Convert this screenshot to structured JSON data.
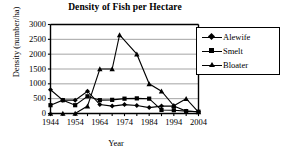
{
  "chart_data": {
    "type": "line",
    "title": "Density of Fish per Hectare",
    "xlabel": "Year",
    "ylabel": "Density (number/ha)",
    "xlim": [
      1944,
      2004
    ],
    "ylim": [
      0,
      3000
    ],
    "yticks": [
      0,
      500,
      1000,
      1500,
      2000,
      2500,
      3000
    ],
    "xticks": [
      1944,
      1954,
      1964,
      1974,
      1984,
      1994,
      2004
    ],
    "xminor_step": 5,
    "grid": "horizontal",
    "legend_position": "top-right",
    "series": [
      {
        "name": "Alewife",
        "marker": "diamond",
        "color": "#000000",
        "x": [
          1944,
          1949,
          1954,
          1959,
          1964,
          1969,
          1974,
          1979,
          1984,
          1989,
          1994,
          1999,
          2004
        ],
        "y": [
          800,
          450,
          450,
          750,
          300,
          250,
          300,
          270,
          200,
          250,
          250,
          80,
          60
        ]
      },
      {
        "name": "Smelt",
        "marker": "square",
        "color": "#000000",
        "x": [
          1944,
          1949,
          1954,
          1959,
          1964,
          1969,
          1974,
          1979,
          1984,
          1989,
          1994,
          1999,
          2004
        ],
        "y": [
          280,
          450,
          280,
          580,
          450,
          460,
          500,
          510,
          500,
          120,
          110,
          80,
          60
        ]
      },
      {
        "name": "Bloater",
        "marker": "triangle",
        "color": "#000000",
        "x": [
          1944,
          1949,
          1954,
          1959,
          1964,
          1969,
          1972,
          1979,
          1984,
          1989,
          1994,
          1999,
          2004
        ],
        "y": [
          0,
          0,
          0,
          250,
          1500,
          1500,
          2650,
          2000,
          1000,
          750,
          260,
          500,
          50
        ]
      }
    ],
    "legend": [
      {
        "label": "Alewife",
        "marker": "diamond"
      },
      {
        "label": "Smelt",
        "marker": "square"
      },
      {
        "label": "Bloater",
        "marker": "triangle"
      }
    ]
  }
}
